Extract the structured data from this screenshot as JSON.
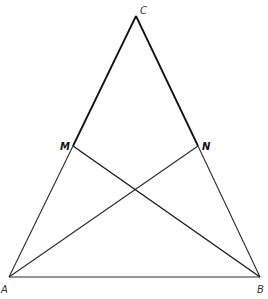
{
  "figure": {
    "stroke_color": "#1a1a1a",
    "background": "#ffffff"
  },
  "points": {
    "A": {
      "label": "A",
      "x": 9,
      "y": 277
    },
    "B": {
      "label": "B",
      "x": 260,
      "y": 277
    },
    "C": {
      "label": "C",
      "x": 136,
      "y": 16
    },
    "M": {
      "label": "M",
      "x": 73,
      "y": 146
    },
    "N": {
      "label": "N",
      "x": 198,
      "y": 146
    }
  },
  "segments": [
    {
      "from": "A",
      "to": "B"
    },
    {
      "from": "A",
      "to": "C"
    },
    {
      "from": "B",
      "to": "C"
    },
    {
      "from": "A",
      "to": "N"
    },
    {
      "from": "B",
      "to": "M"
    }
  ],
  "labels": {
    "A": "A",
    "B": "B",
    "C": "C",
    "M": "M",
    "N": "N"
  }
}
